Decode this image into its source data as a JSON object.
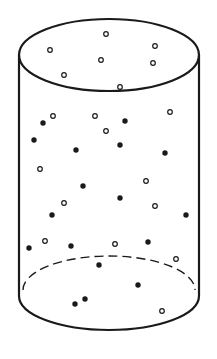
{
  "diagram": {
    "type": "cylinder-with-particles",
    "stroke_color": "#1a1a1a",
    "background": "#ffffff",
    "cylinder": {
      "top_ellipse": {
        "cx": 109,
        "cy": 55,
        "rx": 90,
        "ry": 36
      },
      "bottom_ellipse": {
        "cx": 109,
        "cy": 296,
        "rx": 90,
        "ry": 34
      },
      "left_x": 19,
      "right_x": 199,
      "back_base_dashed": true
    },
    "particle_legend": {
      "open": "hollow circle particle",
      "filled": "solid black particle"
    },
    "particles": {
      "open": [
        [
          106,
          34
        ],
        [
          50,
          50
        ],
        [
          155,
          46
        ],
        [
          101,
          60
        ],
        [
          153,
          63
        ],
        [
          64,
          75
        ],
        [
          120,
          87
        ],
        [
          53,
          116
        ],
        [
          95,
          116
        ],
        [
          170,
          112
        ],
        [
          106,
          131
        ],
        [
          40,
          169
        ],
        [
          146,
          181
        ],
        [
          64,
          203
        ],
        [
          155,
          206
        ],
        [
          45,
          241
        ],
        [
          115,
          244
        ],
        [
          176,
          259
        ],
        [
          162,
          311
        ]
      ],
      "filled": [
        [
          43,
          123
        ],
        [
          125,
          121
        ],
        [
          34,
          140
        ],
        [
          76,
          150
        ],
        [
          120,
          145
        ],
        [
          165,
          153
        ],
        [
          83,
          186
        ],
        [
          120,
          198
        ],
        [
          52,
          215
        ],
        [
          186,
          215
        ],
        [
          29,
          248
        ],
        [
          71,
          246
        ],
        [
          148,
          242
        ],
        [
          99,
          265
        ],
        [
          138,
          285
        ],
        [
          85,
          299
        ],
        [
          75,
          304
        ]
      ]
    }
  }
}
